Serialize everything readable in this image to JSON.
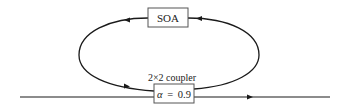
{
  "diagram": {
    "type": "ring-laser-schematic",
    "nodes": {
      "soa": {
        "label": "SOA"
      },
      "coupler": {
        "caption": "2×2 coupler",
        "param_symbol": "α",
        "param_equals": "=",
        "param_value": "0.9",
        "param_text": "α = 0.9"
      }
    },
    "edges": {
      "ring_direction": "counter-clockwise",
      "bus_direction": "left-to-right"
    },
    "colors": {
      "line": "#1a1a1a",
      "box_border": "#555555",
      "text": "#222222"
    }
  }
}
